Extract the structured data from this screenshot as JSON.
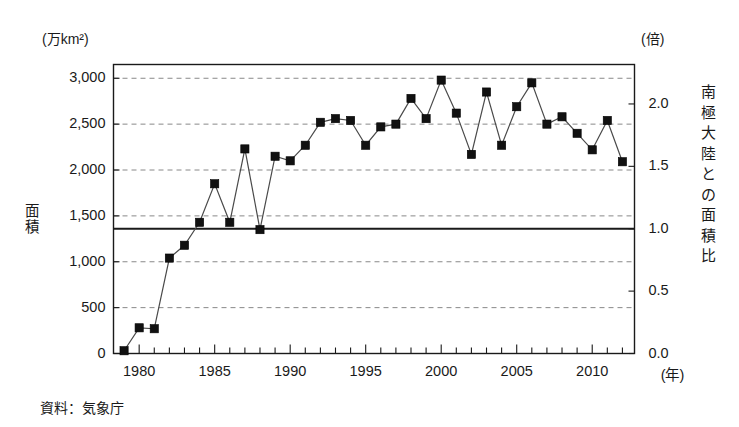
{
  "figure": {
    "unit_left": "(万km²)",
    "unit_right": "(倍)",
    "y_axis_title_left_chars": [
      "面",
      "積"
    ],
    "y_axis_title_right_chars": [
      "南",
      "極",
      "大",
      "陸",
      "と",
      "の",
      "面",
      "積",
      "比"
    ],
    "source_note": "資料：気象庁",
    "x_unit": "(年)"
  },
  "chart_data": {
    "type": "line",
    "title": "",
    "subtitle": "",
    "xlabel": "(年)",
    "ylabel": "面積",
    "ylabel_right": "南極大陸との面積比",
    "unit_left": "(万km²)",
    "unit_right": "(倍)",
    "grid": true,
    "legend": "none",
    "marker": "filled-square",
    "line_color": "#4a4a4a",
    "marker_color": "#111111",
    "reference_line": {
      "label": "南極大陸面積 (比 1.0)",
      "value_left_axis": 1360,
      "value_right_axis": 1.0,
      "style": "solid",
      "color": "#1a1a1a"
    },
    "xlim": [
      1978.3,
      2012.8
    ],
    "ylim": [
      0,
      3150
    ],
    "ylim_right": [
      0.0,
      2.3162
    ],
    "xticks_major": [
      1980,
      1985,
      1990,
      1995,
      2000,
      2005,
      2010
    ],
    "xticks_minor_step": 1,
    "yticks_left": [
      0,
      500,
      1000,
      1500,
      2000,
      2500,
      3000
    ],
    "ytick_labels_left": [
      "0",
      "500",
      "1,000",
      "1,500",
      "2,000",
      "2,500",
      "3,000"
    ],
    "yticks_right": [
      0.0,
      0.5,
      1.0,
      1.5,
      2.0
    ],
    "ytick_labels_right": [
      "0.0",
      "0.5",
      "1.0",
      "1.5",
      "2.0"
    ],
    "x": [
      1979,
      1980,
      1981,
      1982,
      1983,
      1984,
      1985,
      1986,
      1987,
      1988,
      1989,
      1990,
      1991,
      1992,
      1993,
      1994,
      1995,
      1996,
      1997,
      1998,
      1999,
      2000,
      2001,
      2002,
      2003,
      2004,
      2005,
      2006,
      2007,
      2008,
      2009,
      2010,
      2011,
      2012
    ],
    "values": [
      30,
      280,
      270,
      1040,
      1180,
      1430,
      1850,
      1430,
      2230,
      1350,
      2150,
      2100,
      2270,
      2520,
      2560,
      2540,
      2270,
      2470,
      2500,
      2780,
      2560,
      2980,
      2620,
      2170,
      2850,
      2270,
      2690,
      2950,
      2500,
      2580,
      2400,
      2220,
      2540,
      2090
    ],
    "values_right_axis": [
      0.02,
      0.21,
      0.2,
      0.76,
      0.87,
      1.05,
      1.36,
      1.05,
      1.64,
      0.99,
      1.58,
      1.54,
      1.67,
      1.85,
      1.88,
      1.87,
      1.67,
      1.82,
      1.84,
      2.04,
      1.88,
      2.19,
      1.93,
      1.6,
      2.1,
      1.67,
      1.98,
      2.17,
      1.84,
      1.9,
      1.76,
      1.63,
      1.87,
      1.54
    ]
  }
}
